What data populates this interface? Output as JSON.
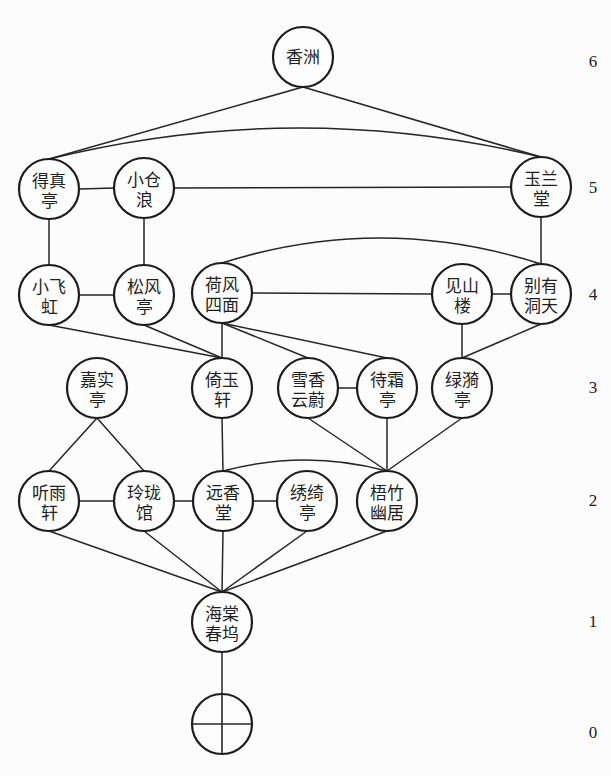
{
  "diagram": {
    "type": "layered node-link graph",
    "node_radius": 30,
    "level_axis_x": 593,
    "colors": {
      "stroke": "#1c1c1c",
      "text": "#1f1f1f",
      "background": "#fcfcfc"
    },
    "levels": [
      {
        "label": "6",
        "y": 61
      },
      {
        "label": "5",
        "y": 187
      },
      {
        "label": "4",
        "y": 294
      },
      {
        "label": "3",
        "y": 387
      },
      {
        "label": "2",
        "y": 500
      },
      {
        "label": "1",
        "y": 621
      },
      {
        "label": "0",
        "y": 732
      }
    ],
    "nodes": [
      {
        "id": "xiangzhou",
        "label": "香洲",
        "lines": [
          "香洲"
        ],
        "level": 6,
        "x": 303,
        "y": 57
      },
      {
        "id": "dezhenting",
        "label": "得真亭",
        "lines": [
          "得真",
          "亭"
        ],
        "level": 5,
        "x": 49,
        "y": 189
      },
      {
        "id": "xiaocanglang",
        "label": "小仓浪",
        "lines": [
          "小仓",
          "浪"
        ],
        "level": 5,
        "x": 144,
        "y": 188
      },
      {
        "id": "yulantang",
        "label": "玉兰堂",
        "lines": [
          "玉兰",
          "堂"
        ],
        "level": 5,
        "x": 541,
        "y": 187
      },
      {
        "id": "xiaofeihong",
        "label": "小飞虹",
        "lines": [
          "小飞",
          "虹"
        ],
        "level": 4,
        "x": 49,
        "y": 295
      },
      {
        "id": "songfengting",
        "label": "松风亭",
        "lines": [
          "松风",
          "亭"
        ],
        "level": 4,
        "x": 144,
        "y": 295
      },
      {
        "id": "hefengsimian",
        "label": "荷风四面",
        "lines": [
          "荷风",
          "四面"
        ],
        "level": 4,
        "x": 222,
        "y": 293
      },
      {
        "id": "jianshanlou",
        "label": "见山楼",
        "lines": [
          "见山",
          "楼"
        ],
        "level": 4,
        "x": 462,
        "y": 294
      },
      {
        "id": "bieyoudongtian",
        "label": "别有洞天",
        "lines": [
          "别有",
          "洞天"
        ],
        "level": 4,
        "x": 541,
        "y": 294
      },
      {
        "id": "jiashiting",
        "label": "嘉实亭",
        "lines": [
          "嘉实",
          "亭"
        ],
        "level": 3,
        "x": 97,
        "y": 388
      },
      {
        "id": "yiyuxuan",
        "label": "倚玉轩",
        "lines": [
          "倚玉",
          "轩"
        ],
        "level": 3,
        "x": 222,
        "y": 388
      },
      {
        "id": "xuexiangyunwei",
        "label": "雪香云蔚",
        "lines": [
          "雪香",
          "云蔚"
        ],
        "level": 3,
        "x": 308,
        "y": 388
      },
      {
        "id": "daishuangting",
        "label": "待霜亭",
        "lines": [
          "待霜",
          "亭"
        ],
        "level": 3,
        "x": 387,
        "y": 388
      },
      {
        "id": "lvyiting",
        "label": "绿漪亭",
        "lines": [
          "绿漪",
          "亭"
        ],
        "level": 3,
        "x": 462,
        "y": 388
      },
      {
        "id": "tingyuxuan",
        "label": "听雨轩",
        "lines": [
          "听雨",
          "轩"
        ],
        "level": 2,
        "x": 49,
        "y": 501
      },
      {
        "id": "linglongguan",
        "label": "玲珑馆",
        "lines": [
          "玲珑",
          "馆"
        ],
        "level": 2,
        "x": 144,
        "y": 501
      },
      {
        "id": "yuanxiangtang",
        "label": "远香堂",
        "lines": [
          "远香",
          "堂"
        ],
        "level": 2,
        "x": 223,
        "y": 501
      },
      {
        "id": "xiuqiting",
        "label": "绣绮亭",
        "lines": [
          "绣绮",
          "亭"
        ],
        "level": 2,
        "x": 307,
        "y": 501
      },
      {
        "id": "wuzhuyouju",
        "label": "梧竹幽居",
        "lines": [
          "梧竹",
          "幽居"
        ],
        "level": 2,
        "x": 387,
        "y": 501
      },
      {
        "id": "haitangchunwu",
        "label": "海棠春坞",
        "lines": [
          "海棠",
          "春坞"
        ],
        "level": 1,
        "x": 222,
        "y": 622
      },
      {
        "id": "entrance",
        "symbol": "crossed-circle",
        "lines": [],
        "level": 0,
        "x": 222,
        "y": 724
      }
    ],
    "edges": [
      {
        "from": "xiangzhou",
        "to": "dezhenting",
        "type": "v"
      },
      {
        "from": "xiangzhou",
        "to": "yulantang",
        "type": "v"
      },
      {
        "from": "dezhenting",
        "to": "yulantang",
        "type": "arc",
        "peak_y": 128
      },
      {
        "from": "dezhenting",
        "to": "xiaocanglang",
        "type": "h"
      },
      {
        "from": "xiaocanglang",
        "to": "yulantang",
        "type": "h"
      },
      {
        "from": "dezhenting",
        "to": "xiaofeihong",
        "type": "v"
      },
      {
        "from": "xiaocanglang",
        "to": "songfengting",
        "type": "v"
      },
      {
        "from": "yulantang",
        "to": "bieyoudongtian",
        "type": "v"
      },
      {
        "from": "xiaofeihong",
        "to": "songfengting",
        "type": "h"
      },
      {
        "from": "hefengsimian",
        "to": "jianshanlou",
        "type": "h"
      },
      {
        "from": "jianshanlou",
        "to": "bieyoudongtian",
        "type": "h"
      },
      {
        "from": "hefengsimian",
        "to": "bieyoudongtian",
        "type": "arc",
        "peak_y": 238
      },
      {
        "from": "xiaofeihong",
        "to": "yiyuxuan",
        "type": "v"
      },
      {
        "from": "songfengting",
        "to": "yiyuxuan",
        "type": "v"
      },
      {
        "from": "hefengsimian",
        "to": "yiyuxuan",
        "type": "v"
      },
      {
        "from": "hefengsimian",
        "to": "xuexiangyunwei",
        "type": "v"
      },
      {
        "from": "hefengsimian",
        "to": "daishuangting",
        "type": "v"
      },
      {
        "from": "jianshanlou",
        "to": "lvyiting",
        "type": "v"
      },
      {
        "from": "bieyoudongtian",
        "to": "lvyiting",
        "type": "v"
      },
      {
        "from": "xuexiangyunwei",
        "to": "daishuangting",
        "type": "h"
      },
      {
        "from": "jiashiting",
        "to": "tingyuxuan",
        "type": "v"
      },
      {
        "from": "jiashiting",
        "to": "linglongguan",
        "type": "v"
      },
      {
        "from": "yiyuxuan",
        "to": "yuanxiangtang",
        "type": "v"
      },
      {
        "from": "xuexiangyunwei",
        "to": "wuzhuyouju",
        "type": "v"
      },
      {
        "from": "daishuangting",
        "to": "wuzhuyouju",
        "type": "v"
      },
      {
        "from": "lvyiting",
        "to": "wuzhuyouju",
        "type": "v"
      },
      {
        "from": "tingyuxuan",
        "to": "linglongguan",
        "type": "h"
      },
      {
        "from": "linglongguan",
        "to": "yuanxiangtang",
        "type": "h"
      },
      {
        "from": "yuanxiangtang",
        "to": "xiuqiting",
        "type": "h"
      },
      {
        "from": "yuanxiangtang",
        "to": "wuzhuyouju",
        "type": "arc",
        "peak_y": 460
      },
      {
        "from": "tingyuxuan",
        "to": "haitangchunwu",
        "type": "v"
      },
      {
        "from": "linglongguan",
        "to": "haitangchunwu",
        "type": "v"
      },
      {
        "from": "yuanxiangtang",
        "to": "haitangchunwu",
        "type": "v"
      },
      {
        "from": "xiuqiting",
        "to": "haitangchunwu",
        "type": "v"
      },
      {
        "from": "wuzhuyouju",
        "to": "haitangchunwu",
        "type": "v"
      },
      {
        "from": "haitangchunwu",
        "to": "entrance",
        "type": "v"
      }
    ]
  }
}
